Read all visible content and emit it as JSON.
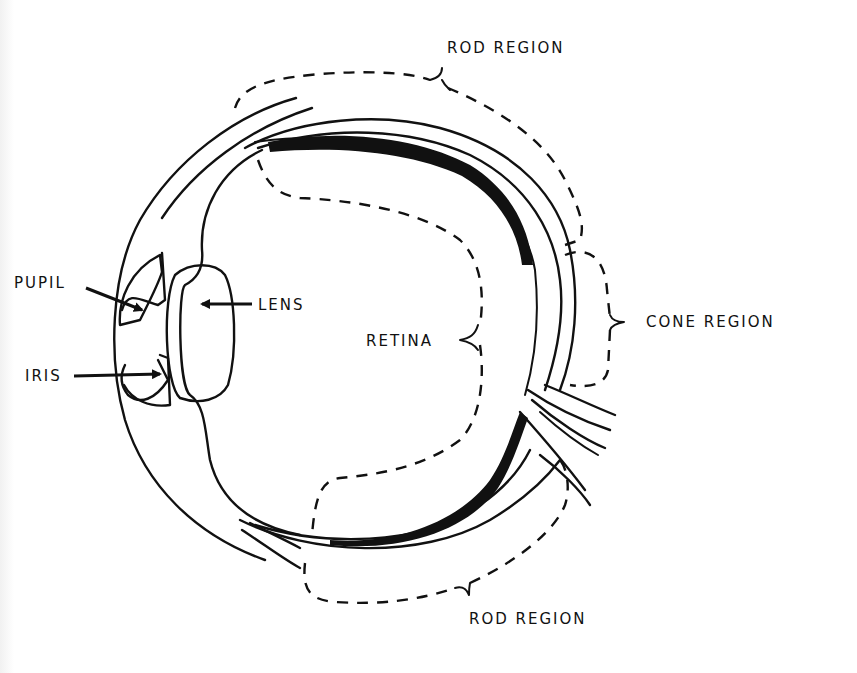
{
  "diagram": {
    "title": "",
    "colors": {
      "ink": "#111111",
      "background": "#ffffff"
    },
    "labels": {
      "rod_region_top": "ROD REGION",
      "cone_region": "CONE REGION",
      "rod_region_bottom": "ROD REGION",
      "retina": "RETINA",
      "pupil": "PUPIL",
      "iris": "IRIS",
      "lens": "LENS"
    },
    "parts": [
      "cornea",
      "iris",
      "pupil",
      "lens",
      "retina",
      "choroid",
      "sclera",
      "optic-nerve",
      "fovea"
    ],
    "brackets": [
      {
        "label": "ROD REGION",
        "position": "top",
        "style": "dashed"
      },
      {
        "label": "CONE REGION",
        "position": "right",
        "style": "dashed"
      },
      {
        "label": "ROD REGION",
        "position": "bottom",
        "style": "dashed"
      },
      {
        "label": "RETINA",
        "position": "interior",
        "style": "dashed"
      }
    ]
  }
}
